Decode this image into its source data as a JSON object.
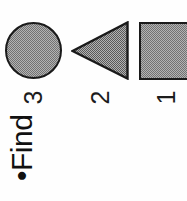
{
  "slide": {
    "background_color": "#fefefe",
    "heading": {
      "bullet": "•",
      "text": "Find",
      "full_text": "•Find",
      "color": "#111111",
      "rotation_degrees": -90
    },
    "rotation_note": "content rotated 90 degrees counter-clockwise",
    "shapes": [
      {
        "label": "1",
        "kind": "square",
        "fill": "halftone-gray",
        "fill_color": "#b3b3b3",
        "outline_color": "#1a1a1a",
        "clipped": "right-edge"
      },
      {
        "label": "2",
        "kind": "triangle",
        "direction": "left",
        "fill": "halftone-gray",
        "fill_color": "#b3b3b3",
        "outline_color": "#1a1a1a",
        "clipped": "none"
      },
      {
        "label": "3",
        "kind": "circle",
        "fill": "halftone-gray",
        "fill_color": "#b3b3b3",
        "outline_color": "#1a1a1a",
        "clipped": "none"
      }
    ],
    "labels": {
      "shape_1": "1",
      "shape_2": "2",
      "shape_3": "3"
    }
  }
}
